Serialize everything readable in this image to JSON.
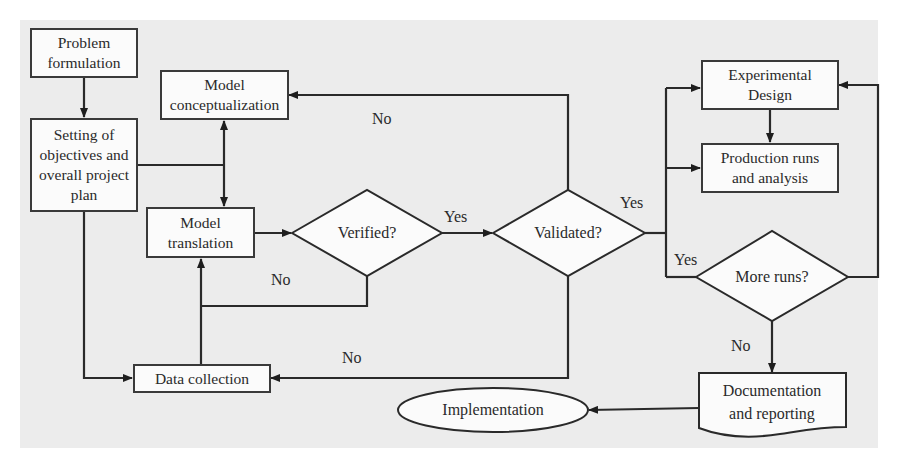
{
  "diagram": {
    "type": "flowchart",
    "nodes": {
      "problem_formulation": "Problem\nformulation",
      "objectives": "Setting of\nobjectives and\noverall project\nplan",
      "model_conceptualization": "Model\nconceptualization",
      "model_translation": "Model\ntranslation",
      "verified": "Verified?",
      "validated": "Validated?",
      "data_collection": "Data collection",
      "experimental_design": "Experimental\nDesign",
      "production_runs": "Production runs\nand analysis",
      "more_runs": "More runs?",
      "documentation": "Documentation\nand reporting",
      "implementation": "Implementation"
    },
    "edge_labels": {
      "validated_no_top": "No",
      "verified_yes": "Yes",
      "verified_no": "No",
      "validated_yes": "Yes",
      "validated_no_bottom": "No",
      "more_runs_yes": "Yes",
      "more_runs_no": "No"
    },
    "edges": [
      {
        "from": "Problem formulation",
        "to": "Setting of objectives and overall project plan"
      },
      {
        "from": "Setting of objectives and overall project plan",
        "to": "Model conceptualization"
      },
      {
        "from": "Setting of objectives and overall project plan",
        "to": "Model translation"
      },
      {
        "from": "Setting of objectives and overall project plan",
        "to": "Data collection"
      },
      {
        "from": "Model translation",
        "to": "Verified?"
      },
      {
        "from": "Data collection",
        "to": "Model translation"
      },
      {
        "from": "Verified?",
        "to": "Validated?",
        "label": "Yes"
      },
      {
        "from": "Verified?",
        "to": "Model translation",
        "label": "No"
      },
      {
        "from": "Validated?",
        "to": "Model conceptualization",
        "label": "No"
      },
      {
        "from": "Validated?",
        "to": "Data collection",
        "label": "No"
      },
      {
        "from": "Validated?",
        "to": "Experimental Design",
        "label": "Yes"
      },
      {
        "from": "Validated?",
        "to": "Production runs and analysis",
        "label": "Yes"
      },
      {
        "from": "Experimental Design",
        "to": "Production runs and analysis"
      },
      {
        "from": "More runs?",
        "to": "Experimental Design",
        "label": "Yes"
      },
      {
        "from": "More runs?",
        "to": "Documentation and reporting",
        "label": "No"
      },
      {
        "from": "Documentation and reporting",
        "to": "Implementation"
      }
    ]
  }
}
